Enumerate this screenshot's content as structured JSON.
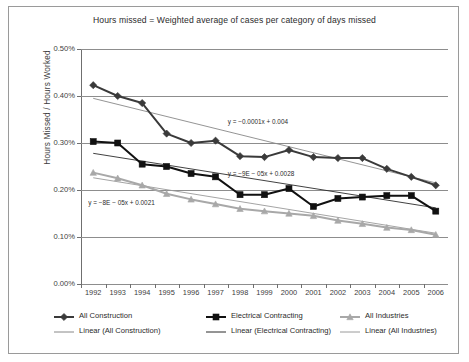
{
  "chart_data": {
    "type": "line",
    "title": "Hours missed = Weighted average of cases per category of days missed",
    "xlabel": "",
    "ylabel": "Hours Missed / Hours Worked",
    "categories": [
      "1992",
      "1993",
      "1994",
      "1995",
      "1996",
      "1997",
      "1998",
      "1999",
      "2000",
      "2001",
      "2002",
      "2003",
      "2004",
      "2005",
      "2006"
    ],
    "ylim": [
      0.0,
      0.5
    ],
    "ytick_labels": [
      "0.00%",
      "0.10%",
      "0.20%",
      "0.30%",
      "0.40%",
      "0.50%"
    ],
    "ytick_values": [
      0.0,
      0.1,
      0.2,
      0.3,
      0.4,
      0.5
    ],
    "grid": true,
    "legend_position": "bottom",
    "units": "percent",
    "series": [
      {
        "name": "All Construction",
        "marker": "diamond",
        "color": "#3a3a3a",
        "values": [
          0.423,
          0.4,
          0.385,
          0.32,
          0.3,
          0.305,
          0.272,
          0.27,
          0.285,
          0.27,
          0.268,
          0.268,
          0.245,
          0.228,
          0.21
        ]
      },
      {
        "name": "Electrical Contracting",
        "marker": "square",
        "color": "#111111",
        "values": [
          0.303,
          0.3,
          0.255,
          0.25,
          0.235,
          0.228,
          0.19,
          0.19,
          0.203,
          0.165,
          0.182,
          0.185,
          0.188,
          0.188,
          0.155
        ]
      },
      {
        "name": "All Industries",
        "marker": "triangle",
        "color": "#a8a8a8",
        "values": [
          0.237,
          0.225,
          0.21,
          0.192,
          0.18,
          0.17,
          0.16,
          0.155,
          0.15,
          0.145,
          0.135,
          0.128,
          0.12,
          0.115,
          0.105
        ]
      }
    ],
    "trendlines": [
      {
        "name": "Linear (All Construction)",
        "color": "#888888",
        "equation": "y = −0.0001x + 0.004",
        "equation_x": 0.4,
        "equation_y": 0.345,
        "start": 0.395,
        "end": 0.215
      },
      {
        "name": "Linear (Electrical Contracting)",
        "color": "#2b2b2b",
        "equation": "y = −9E − 05x + 0.0028",
        "equation_x": 0.4,
        "equation_y": 0.235,
        "start": 0.278,
        "end": 0.162
      },
      {
        "name": "Linear (All Industries)",
        "color": "#9a9a9a",
        "equation": "y = −8E − 05x + 0.0021",
        "equation_x": 0.02,
        "equation_y": 0.173,
        "start": 0.226,
        "end": 0.108
      }
    ],
    "legend": [
      {
        "label": "All Construction",
        "kind": "marker",
        "marker": "diamond",
        "color": "#3a3a3a"
      },
      {
        "label": "Electrical Contracting",
        "kind": "marker",
        "marker": "square",
        "color": "#111111"
      },
      {
        "label": "All Industries",
        "kind": "marker",
        "marker": "triangle",
        "color": "#a8a8a8"
      },
      {
        "label": "Linear (All Construction)",
        "kind": "line",
        "marker": "none",
        "color": "#888888"
      },
      {
        "label": "Linear (Electrical Contracting)",
        "kind": "line",
        "marker": "none",
        "color": "#2b2b2b"
      },
      {
        "label": "Linear (All Industries)",
        "kind": "line",
        "marker": "none",
        "color": "#9a9a9a"
      }
    ]
  }
}
